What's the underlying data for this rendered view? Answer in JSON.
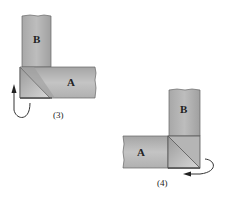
{
  "diagram": {
    "type": "binding corner folding steps",
    "figures": [
      {
        "id": "step3",
        "caption": "(3)",
        "strip_vertical_label": "B",
        "strip_horizontal_label": "A",
        "arrow_direction": "up, curling from below at left"
      },
      {
        "id": "step4",
        "caption": "(4)",
        "strip_vertical_label": "B",
        "strip_horizontal_label": "A",
        "arrow_direction": "left, curling from right side"
      }
    ],
    "colors": {
      "strip_fill": "#b8b8b8",
      "strip_dark": "#8e8e8e",
      "strip_light": "#d4d4d4",
      "outline": "#555555",
      "background": "#ffffff"
    }
  }
}
